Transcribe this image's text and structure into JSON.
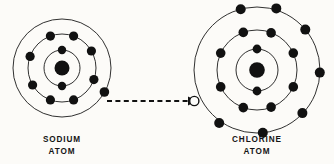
{
  "figure": {
    "background_color": "#fcfbf8",
    "ink_color": "#111111"
  },
  "atoms": [
    {
      "id": "sodium",
      "label_line1": "SODIUM",
      "label_line2": "ATOM",
      "element_symbol": "Na",
      "center": {
        "x": 62,
        "y": 68
      },
      "nucleus_radius": 7.5,
      "label_position": {
        "x": 62,
        "y": 142
      },
      "shells": [
        {
          "index": 1,
          "radius": 18,
          "electron_count": 2,
          "electron_angles": [
            270,
            90
          ]
        },
        {
          "index": 2,
          "radius": 34,
          "electron_count": 8,
          "electron_angles": [
            250,
            290,
            330,
            20,
            70,
            110,
            150,
            200
          ]
        },
        {
          "index": 3,
          "radius": 49,
          "electron_count": 1,
          "electron_angles": [
            30
          ]
        }
      ]
    },
    {
      "id": "chlorine",
      "label_line1": "CHLORINE",
      "label_line2": "ATOM",
      "element_symbol": "Cl",
      "center": {
        "x": 257,
        "y": 70
      },
      "nucleus_radius": 7.5,
      "label_position": {
        "x": 257,
        "y": 142
      },
      "shells": [
        {
          "index": 1,
          "radius": 21,
          "electron_count": 2,
          "electron_angles": [
            270,
            90
          ]
        },
        {
          "index": 2,
          "radius": 40,
          "electron_count": 8,
          "electron_angles": [
            250,
            290,
            335,
            25,
            65,
            115,
            155,
            205
          ]
        },
        {
          "index": 3,
          "radius": 63,
          "electron_count": 8,
          "electron_angles": [
            255,
            285,
            320,
            0,
            40,
            75,
            105,
            180
          ],
          "open_slot_angle": 180
        }
      ]
    }
  ],
  "transfer": {
    "description": "dashed arrow showing valence electron moving from sodium to chlorine",
    "start": {
      "x": 107,
      "y": 101
    },
    "end": {
      "x": 194,
      "y": 101
    },
    "style": "dashed",
    "arrowhead": "right"
  }
}
